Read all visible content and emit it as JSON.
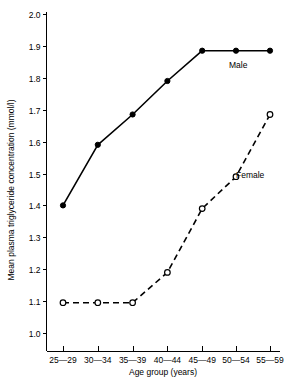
{
  "chart_data": {
    "type": "line",
    "title": "",
    "xlabel": "Age group (years)",
    "ylabel": "Mean plasma triglyceride concentration (mmol/l)",
    "categories": [
      "25—29",
      "30—34",
      "35—39",
      "40—44",
      "45—49",
      "50—54",
      "55—59"
    ],
    "ylim": [
      1.0,
      2.0
    ],
    "ytick_labels": [
      "2.0",
      "1.9",
      "1.8",
      "1.7",
      "1.6",
      "1.5",
      "1.4",
      "1.3",
      "1.2",
      "1.1",
      "1.0"
    ],
    "ytick_values": [
      2.0,
      1.9,
      1.8,
      1.7,
      1.6,
      1.5,
      1.4,
      1.3,
      1.2,
      1.1,
      1.0
    ],
    "grid": false,
    "legend_position": "inline-annotation",
    "series": [
      {
        "name": "Male",
        "style": "solid",
        "marker": "filled-circle",
        "values": [
          1.4,
          1.59,
          1.685,
          1.79,
          1.885,
          1.885,
          1.885
        ]
      },
      {
        "name": "Female",
        "style": "dashed",
        "marker": "open-circle",
        "values": [
          1.095,
          1.095,
          1.095,
          1.19,
          1.39,
          1.49,
          1.685
        ]
      }
    ],
    "annotations": [
      {
        "text": "Male",
        "series": "Male"
      },
      {
        "text": "Female",
        "series": "Female"
      }
    ],
    "colors": {
      "ink": "#000000",
      "background": "#ffffff"
    }
  }
}
